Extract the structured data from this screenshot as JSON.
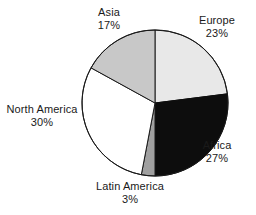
{
  "chart_data": {
    "type": "pie",
    "title": "",
    "subtitle": "",
    "xlabel": "",
    "ylabel": "",
    "legend_position": "none",
    "grid": false,
    "units": "percent",
    "start_angle_deg": 0,
    "direction": "clockwise",
    "categories": [
      "Europe",
      "Africa",
      "Latin America",
      "North America",
      "Asia"
    ],
    "values": [
      23,
      27,
      3,
      30,
      17
    ],
    "slices": [
      {
        "label": "Europe",
        "value": 23,
        "value_text": "23%",
        "color": "#e8e8e8",
        "stroke": "#1a1a1a"
      },
      {
        "label": "Africa",
        "value": 27,
        "value_text": "27%",
        "color": "#0d0d0d",
        "stroke": "#0d0d0d"
      },
      {
        "label": "Latin America",
        "value": 3,
        "value_text": "3%",
        "color": "#a0a0a0",
        "stroke": "#1a1a1a"
      },
      {
        "label": "North America",
        "value": 30,
        "value_text": "30%",
        "color": "#ffffff",
        "stroke": "#1a1a1a"
      },
      {
        "label": "Asia",
        "value": 17,
        "value_text": "17%",
        "color": "#c8c8c8",
        "stroke": "#1a1a1a"
      }
    ]
  },
  "geometry": {
    "center_x": 155,
    "center_y": 103,
    "radius": 73
  },
  "labels": {
    "asia": {
      "name": "Asia",
      "value": "17%"
    },
    "europe": {
      "name": "Europe",
      "value": "23%"
    },
    "africa": {
      "name": "Africa",
      "value": "27%"
    },
    "north_america": {
      "name": "North America",
      "value": "30%"
    },
    "latin_america": {
      "name": "Latin America",
      "value": "3%"
    }
  }
}
